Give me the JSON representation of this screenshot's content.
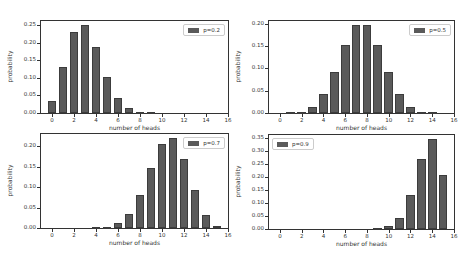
{
  "chart_data": [
    {
      "type": "bar",
      "title": "",
      "legend": "p=0.2",
      "legend_position": "upper right",
      "xlabel": "number of heads",
      "ylabel": "probability",
      "x": [
        0,
        1,
        2,
        3,
        4,
        5,
        6,
        7,
        8,
        9,
        10,
        11,
        12,
        13,
        14,
        15
      ],
      "values": [
        0.035,
        0.132,
        0.231,
        0.25,
        0.188,
        0.103,
        0.043,
        0.014,
        0.003,
        0.001,
        0.0,
        0.0,
        0.0,
        0.0,
        0.0,
        0.0
      ],
      "xticks": [
        "0",
        "2",
        "4",
        "6",
        "8",
        "10",
        "12",
        "14",
        "16"
      ],
      "yticks": [
        "0.00",
        "0.05",
        "0.10",
        "0.15",
        "0.20",
        "0.25"
      ],
      "xlim": [
        -1,
        16
      ],
      "ylim": [
        0,
        0.262
      ],
      "grid": false
    },
    {
      "type": "bar",
      "title": "",
      "legend": "p=0.5",
      "legend_position": "upper right",
      "xlabel": "number of heads",
      "ylabel": "probability",
      "x": [
        0,
        1,
        2,
        3,
        4,
        5,
        6,
        7,
        8,
        9,
        10,
        11,
        12,
        13,
        14,
        15
      ],
      "values": [
        0.0,
        0.0005,
        0.003,
        0.014,
        0.042,
        0.092,
        0.153,
        0.196,
        0.196,
        0.153,
        0.092,
        0.042,
        0.014,
        0.003,
        0.0005,
        0.0
      ],
      "xticks": [
        "0",
        "2",
        "4",
        "6",
        "8",
        "10",
        "12",
        "14",
        "16"
      ],
      "yticks": [
        "0.00",
        "0.05",
        "0.10",
        "0.15",
        "0.20"
      ],
      "xlim": [
        -1,
        16
      ],
      "ylim": [
        0,
        0.206
      ],
      "grid": false
    },
    {
      "type": "bar",
      "title": "",
      "legend": "p=0.7",
      "legend_position": "upper right",
      "xlabel": "number of heads",
      "ylabel": "probability",
      "x": [
        0,
        1,
        2,
        3,
        4,
        5,
        6,
        7,
        8,
        9,
        10,
        11,
        12,
        13,
        14,
        15
      ],
      "values": [
        0.0,
        0.0,
        0.0,
        0.0,
        0.001,
        0.003,
        0.012,
        0.035,
        0.081,
        0.147,
        0.206,
        0.219,
        0.17,
        0.092,
        0.031,
        0.005
      ],
      "xticks": [
        "0",
        "2",
        "4",
        "6",
        "8",
        "10",
        "12",
        "14",
        "16"
      ],
      "yticks": [
        "0.00",
        "0.05",
        "0.10",
        "0.15",
        "0.20"
      ],
      "xlim": [
        -1,
        16
      ],
      "ylim": [
        0,
        0.23
      ],
      "grid": false
    },
    {
      "type": "bar",
      "title": "",
      "legend": "p=0.9",
      "legend_position": "upper left",
      "xlabel": "number of heads",
      "ylabel": "probability",
      "x": [
        0,
        1,
        2,
        3,
        4,
        5,
        6,
        7,
        8,
        9,
        10,
        11,
        12,
        13,
        14,
        15
      ],
      "values": [
        0.0,
        0.0,
        0.0,
        0.0,
        0.0,
        0.0,
        0.0,
        0.0,
        0.0,
        0.002,
        0.01,
        0.043,
        0.129,
        0.267,
        0.343,
        0.206
      ],
      "xticks": [
        "0",
        "2",
        "4",
        "6",
        "8",
        "10",
        "12",
        "14",
        "16"
      ],
      "yticks": [
        "0.00",
        "0.05",
        "0.10",
        "0.15",
        "0.20",
        "0.25",
        "0.30",
        "0.35"
      ],
      "xlim": [
        -1,
        16
      ],
      "ylim": [
        0,
        0.36
      ],
      "grid": false
    }
  ],
  "layout": {
    "panels": [
      {
        "left": 40,
        "top": 20,
        "width": 189,
        "height": 94
      },
      {
        "left": 268,
        "top": 20,
        "width": 187,
        "height": 94
      },
      {
        "left": 40,
        "top": 133,
        "width": 189,
        "height": 96
      },
      {
        "left": 268,
        "top": 134,
        "width": 187,
        "height": 96
      }
    ],
    "bar_color": "#5a5a5a"
  }
}
